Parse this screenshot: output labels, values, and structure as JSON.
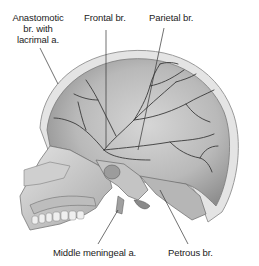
{
  "figure": {
    "labels": [
      {
        "id": "anastomotic",
        "lines": [
          "Anastomotic",
          "br. with",
          "lacrimal a."
        ]
      },
      {
        "id": "frontal",
        "text": "Frontal br."
      },
      {
        "id": "parietal",
        "text": "Parietal br."
      },
      {
        "id": "middle_meningeal",
        "text": "Middle meningeal a."
      },
      {
        "id": "petrous",
        "text": "Petrous br."
      }
    ],
    "colors": {
      "background": "#ffffff",
      "text": "#222222",
      "leader": "#333333",
      "bone_light": "#d9d9d9",
      "bone_mid": "#a8a8a8",
      "bone_dark": "#6e6e6e",
      "vessel": "#3a3a3a"
    }
  }
}
